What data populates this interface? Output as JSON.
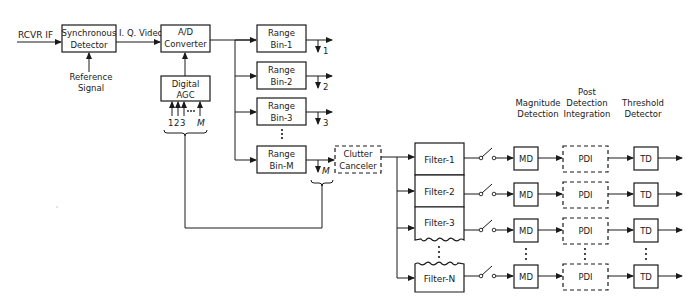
{
  "diagram": {
    "input_label": "RCVR IF",
    "sync_detector": {
      "line1": "Synchronous",
      "line2": "Detector"
    },
    "reference_signal": {
      "line1": "Reference",
      "line2": "Signal"
    },
    "iq_video_label": "I. Q. Video",
    "ad_converter": {
      "line1": "A/D",
      "line2": "Converter"
    },
    "digital_agc": {
      "line1": "Digital",
      "line2": "AGC",
      "inputs": [
        "1",
        "2",
        "3",
        "M"
      ]
    },
    "range_bins": [
      {
        "line1": "Range",
        "line2": "Bin-1",
        "output": "1"
      },
      {
        "line1": "Range",
        "line2": "Bin-2",
        "output": "2"
      },
      {
        "line1": "Range",
        "line2": "Bin-3",
        "output": "3"
      },
      {
        "line1": "Range",
        "line2": "Bin-M",
        "output": "M"
      }
    ],
    "clutter_canceler": {
      "line1": "Clutter",
      "line2": "Canceler"
    },
    "filters": [
      "Filter-1",
      "Filter-2",
      "Filter-3",
      "Filter-N"
    ],
    "column_headers": {
      "magnitude": {
        "line1": "Magnitude",
        "line2": "Detection"
      },
      "pdi": {
        "line1": "Post",
        "line2": "Detection",
        "line3": "Integration"
      },
      "threshold": {
        "line1": "Threshold",
        "line2": "Detector"
      }
    },
    "md_label": "MD",
    "pdi_label": "PDI",
    "td_label": "TD",
    "colors": {
      "line": "#1a1a1a",
      "background": "#ffffff"
    }
  }
}
